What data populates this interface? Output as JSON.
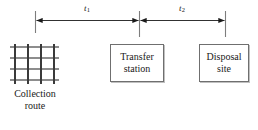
{
  "diagram": {
    "width": 258,
    "height": 130,
    "colors": {
      "line": "#3a3a3a",
      "grid_horizontal": "#8d8d8d",
      "grid_vertical": "#3a3a3a",
      "box_border": "#6f6f6f",
      "box_fill": "#ffffff",
      "text": "#1a1a1a",
      "background": "#ffffff"
    }
  },
  "spans": [
    {
      "id": "t1",
      "symbol": "t",
      "subscript": "1",
      "from": "collection-route",
      "to": "transfer-station"
    },
    {
      "id": "t2",
      "symbol": "t",
      "subscript": "2",
      "from": "transfer-station",
      "to": "disposal-site"
    }
  ],
  "nodes": {
    "collection_route": {
      "caption_line1": "Collection",
      "caption_line2": "route",
      "grid": {
        "horizontal_lines": 4,
        "vertical_lines": 4
      }
    },
    "transfer_station": {
      "label_line1": "Transfer",
      "label_line2": "station"
    },
    "disposal_site": {
      "label_line1": "Disposal",
      "label_line2": "site"
    }
  }
}
